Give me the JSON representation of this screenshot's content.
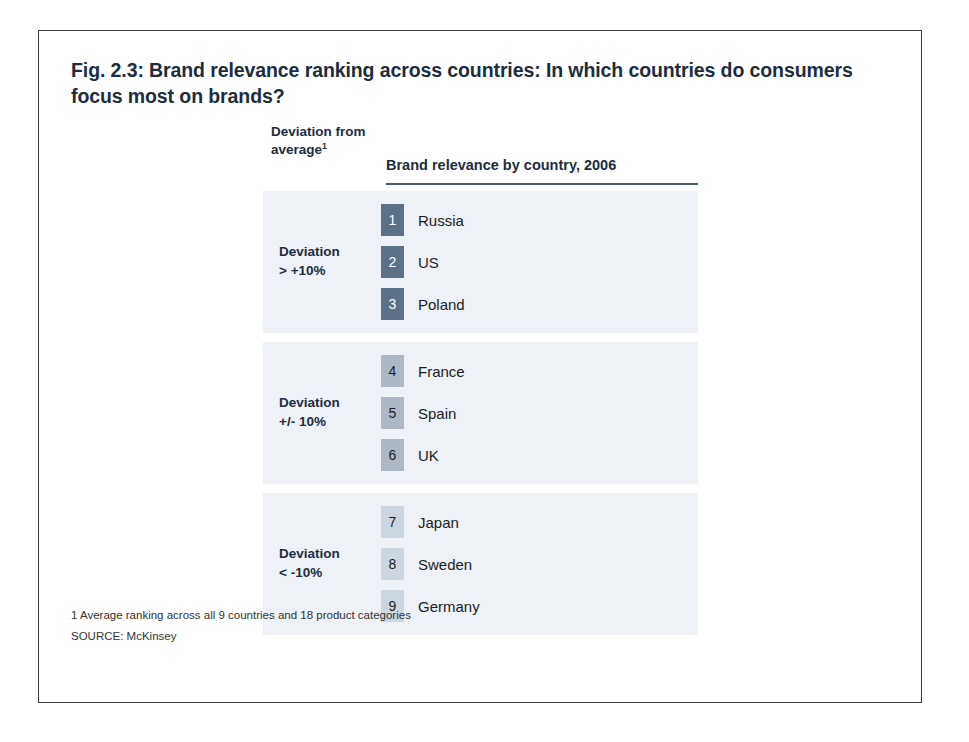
{
  "figure": {
    "title": "Fig. 2.3: Brand relevance ranking across countries: In which countries do consumers focus most on brands?",
    "deviation_column_header": "Deviation from average",
    "deviation_column_header_footnote_marker": "1",
    "ranking_column_header": "Brand relevance by country, 2006"
  },
  "footnotes": {
    "note1": "1 Average ranking across all 9 countries and 18 product categories",
    "source": "SOURCE: McKinsey"
  },
  "colors": {
    "band_background": "#eef1f5",
    "badge_high": "#5d7186",
    "badge_mid": "#adb8c4",
    "badge_low": "#ccd6e0",
    "badge_text_light": "#ffffff",
    "badge_text_dark": "#1c1c1c",
    "heading_text": "#1d2d3e",
    "rule": "#4a5a6a",
    "frame": "#3a3a3a"
  },
  "chart_data": {
    "type": "table",
    "title": "Brand relevance ranking across countries: In which countries do consumers focus most on brands?",
    "subtitle": "Brand relevance by country, 2006",
    "xlabel": "",
    "ylabel": "Deviation from average",
    "columns": [
      "Rank",
      "Country",
      "Deviation from average"
    ],
    "groups": [
      {
        "label": "Deviation > +10%",
        "label_line1": "Deviation",
        "label_line2": "> +10%",
        "badge_color": "#5d7186",
        "badge_text_color": "#ffffff",
        "rows": [
          {
            "rank": "1",
            "country": "Russia"
          },
          {
            "rank": "2",
            "country": "US"
          },
          {
            "rank": "3",
            "country": "Poland"
          }
        ]
      },
      {
        "label": "Deviation +/- 10%",
        "label_line1": "Deviation",
        "label_line2": "+/- 10%",
        "badge_color": "#adb8c4",
        "badge_text_color": "#1c1c1c",
        "rows": [
          {
            "rank": "4",
            "country": "France"
          },
          {
            "rank": "5",
            "country": "Spain"
          },
          {
            "rank": "6",
            "country": "UK"
          }
        ]
      },
      {
        "label": "Deviation < -10%",
        "label_line1": "Deviation",
        "label_line2": "< -10%",
        "badge_color": "#ccd6e0",
        "badge_text_color": "#1c1c1c",
        "rows": [
          {
            "rank": "7",
            "country": "Japan"
          },
          {
            "rank": "8",
            "country": "Sweden"
          },
          {
            "rank": "9",
            "country": "Germany"
          }
        ]
      }
    ],
    "ranking_order": [
      "Russia",
      "US",
      "Poland",
      "France",
      "Spain",
      "UK",
      "Japan",
      "Sweden",
      "Germany"
    ],
    "legend_position": "left",
    "grid": false
  }
}
